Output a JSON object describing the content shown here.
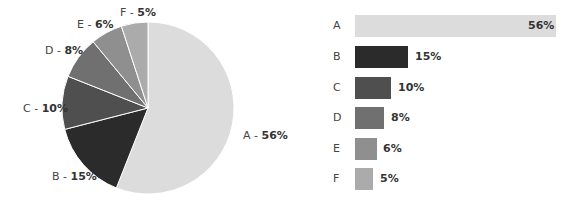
{
  "chart_data": [
    {
      "type": "pie",
      "title": "",
      "categories": [
        "A",
        "B",
        "C",
        "D",
        "E",
        "F"
      ],
      "values": [
        56,
        15,
        10,
        8,
        6,
        5
      ],
      "labels": [
        "A - 56%",
        "B - 15%",
        "C - 10%",
        "D - 8%",
        "E - 6%",
        "F - 5%"
      ],
      "colors": [
        "#dcdcdc",
        "#2b2b2b",
        "#4f4f4f",
        "#707070",
        "#8f8f8f",
        "#ababab"
      ]
    },
    {
      "type": "bar",
      "orientation": "horizontal",
      "title": "",
      "categories": [
        "A",
        "B",
        "C",
        "D",
        "E",
        "F"
      ],
      "values": [
        56,
        15,
        10,
        8,
        6,
        5
      ],
      "value_labels": [
        "56%",
        "15%",
        "10%",
        "8%",
        "6%",
        "5%"
      ],
      "colors": [
        "#dcdcdc",
        "#2b2b2b",
        "#4f4f4f",
        "#707070",
        "#8f8f8f",
        "#ababab"
      ],
      "xlabel": "",
      "ylabel": ""
    }
  ],
  "pie": {
    "labels": [
      {
        "cat": "A - ",
        "pct": "56%"
      },
      {
        "cat": "B - ",
        "pct": "15%"
      },
      {
        "cat": "C - ",
        "pct": "10%"
      },
      {
        "cat": "D - ",
        "pct": "8%"
      },
      {
        "cat": "E - ",
        "pct": "6%"
      },
      {
        "cat": "F - ",
        "pct": "5%"
      }
    ]
  },
  "bars": {
    "rows": [
      {
        "cat": "A",
        "pct": "56%"
      },
      {
        "cat": "B",
        "pct": "15%"
      },
      {
        "cat": "C",
        "pct": "10%"
      },
      {
        "cat": "D",
        "pct": "8%"
      },
      {
        "cat": "E",
        "pct": "6%"
      },
      {
        "cat": "F",
        "pct": "5%"
      }
    ]
  }
}
